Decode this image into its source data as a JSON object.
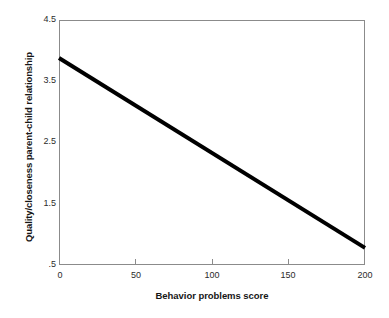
{
  "chart_data": {
    "type": "line",
    "title": "",
    "xlabel": "Behavior problems score",
    "ylabel": "Quality/closeness parent-child relationship",
    "xlim": [
      0,
      200
    ],
    "ylim": [
      0.5,
      4.5
    ],
    "xticks": [
      "0",
      "50",
      "100",
      "150",
      "200"
    ],
    "xtick_values": [
      0,
      50,
      100,
      150,
      200
    ],
    "yticks": [
      "4.5",
      "3.5",
      "2.5",
      "1.5",
      ".5"
    ],
    "ytick_values": [
      4.5,
      3.5,
      2.5,
      1.5,
      0.5
    ],
    "grid": false,
    "legend": "none",
    "series": [
      {
        "name": "Regression line",
        "color": "#000000",
        "linewidth": 4,
        "x": [
          0,
          200
        ],
        "values": [
          3.88,
          0.78
        ]
      }
    ],
    "annotations": []
  },
  "axes": {
    "frame_color": "#8b8b8b",
    "background": "#ffffff"
  }
}
